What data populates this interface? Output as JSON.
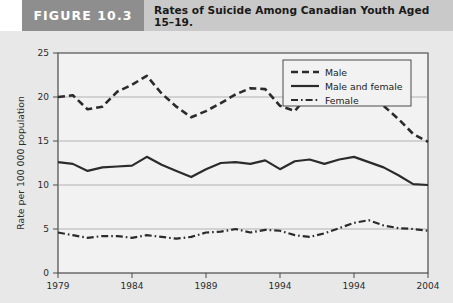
{
  "header": {
    "figure_number": "FIGURE 10.3",
    "title": "Rates of Suicide Among Canadian Youth Aged 15–19.",
    "number_box_color": "#8e8e8e",
    "title_box_color": "#c9c9c9"
  },
  "chart_data": {
    "type": "line",
    "title": "Rates of Suicide Among Canadian Youth Aged 15–19.",
    "xlabel": "",
    "ylabel": "Rate per 100 000 population",
    "xlim": [
      1979,
      2004
    ],
    "ylim": [
      0,
      25
    ],
    "ytick_labels": [
      "0",
      "5",
      "10",
      "15",
      "20",
      "25"
    ],
    "yticks": [
      0,
      5,
      10,
      15,
      20,
      25
    ],
    "xtick_labels": [
      "1979",
      "1984",
      "1989",
      "1994",
      "1994",
      "2004"
    ],
    "xticks": [
      1979,
      1984,
      1989,
      1994,
      1999,
      2004
    ],
    "grid": "horizontal",
    "legend_position": "top-right",
    "plot_background": "#f2f2f2",
    "line_color": "#2b2b2b",
    "x": [
      1979,
      1980,
      1981,
      1982,
      1983,
      1984,
      1985,
      1986,
      1987,
      1988,
      1989,
      1990,
      1991,
      1992,
      1993,
      1994,
      1995,
      1996,
      1997,
      1998,
      1999,
      2000,
      2001,
      2002,
      2003,
      2004
    ],
    "series": [
      {
        "name": "Male",
        "style": "dashed",
        "values": [
          20.0,
          20.2,
          18.6,
          18.9,
          20.6,
          21.4,
          22.4,
          20.4,
          18.9,
          17.7,
          18.4,
          19.3,
          20.3,
          21.0,
          20.9,
          19.0,
          18.4,
          20.4,
          20.0,
          19.3,
          21.1,
          20.1,
          19.0,
          17.5,
          15.8,
          14.9
        ]
      },
      {
        "name": "Male and female",
        "style": "solid",
        "values": [
          12.6,
          12.4,
          11.6,
          12.0,
          12.1,
          12.2,
          13.2,
          12.3,
          11.6,
          10.9,
          11.8,
          12.5,
          12.6,
          12.4,
          12.8,
          11.8,
          12.7,
          12.9,
          12.4,
          12.9,
          13.2,
          12.6,
          12.0,
          11.1,
          10.1,
          10.0
        ]
      },
      {
        "name": "Female",
        "style": "dash-dot",
        "values": [
          4.6,
          4.3,
          4.0,
          4.2,
          4.2,
          4.0,
          4.3,
          4.1,
          3.9,
          4.1,
          4.6,
          4.7,
          5.0,
          4.6,
          4.9,
          4.8,
          4.3,
          4.1,
          4.5,
          5.1,
          5.7,
          6.0,
          5.4,
          5.1,
          5.0,
          4.8
        ]
      }
    ]
  }
}
